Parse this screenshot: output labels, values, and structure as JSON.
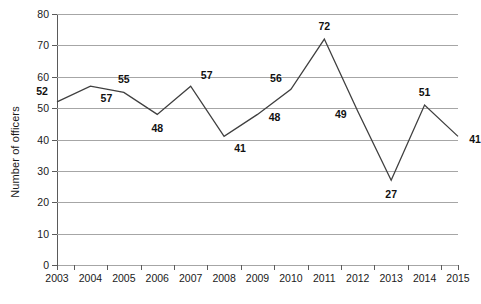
{
  "chart_data": {
    "type": "line",
    "title": "",
    "xlabel": "",
    "ylabel": "Number of officers",
    "categories": [
      "2003",
      "2004",
      "2005",
      "2006",
      "2007",
      "2008",
      "2009",
      "2010",
      "2011",
      "2012",
      "2013",
      "2014",
      "2015"
    ],
    "values": [
      52,
      57,
      55,
      48,
      57,
      41,
      48,
      56,
      72,
      49,
      27,
      51,
      41
    ],
    "series": [
      {
        "name": "Number of officers",
        "values": [
          52,
          57,
          55,
          48,
          57,
          41,
          48,
          56,
          72,
          49,
          27,
          51,
          41
        ]
      }
    ],
    "ylim": [
      0,
      80
    ],
    "ytick_values": [
      0,
      10,
      20,
      30,
      40,
      50,
      60,
      70,
      80
    ],
    "ytick_labels": [
      "0",
      "10",
      "20",
      "30",
      "40",
      "50",
      "60",
      "70",
      "80"
    ],
    "grid": "horizontal",
    "legend": "none",
    "data_labels": [
      {
        "category": "2003",
        "value": 52,
        "text": "52",
        "placement": "above-left"
      },
      {
        "category": "2004",
        "value": 57,
        "text": "57",
        "placement": "below-right"
      },
      {
        "category": "2005",
        "value": 55,
        "text": "55",
        "placement": "above"
      },
      {
        "category": "2006",
        "value": 48,
        "text": "48",
        "placement": "below"
      },
      {
        "category": "2007",
        "value": 57,
        "text": "57",
        "placement": "above-right"
      },
      {
        "category": "2008",
        "value": 41,
        "text": "41",
        "placement": "below-right"
      },
      {
        "category": "2009",
        "value": 48,
        "text": "48",
        "placement": "right"
      },
      {
        "category": "2010",
        "value": 56,
        "text": "56",
        "placement": "above-left"
      },
      {
        "category": "2011",
        "value": 72,
        "text": "72",
        "placement": "above"
      },
      {
        "category": "2012",
        "value": 49,
        "text": "49",
        "placement": "left"
      },
      {
        "category": "2013",
        "value": 27,
        "text": "27",
        "placement": "below"
      },
      {
        "category": "2014",
        "value": 51,
        "text": "51",
        "placement": "above"
      },
      {
        "category": "2015",
        "value": 41,
        "text": "41",
        "placement": "right"
      }
    ],
    "colors": {
      "line": "#3f3f3f",
      "gridline": "#a6a6a6",
      "axis": "#5a5a5a",
      "label_text": "#111111",
      "background": "#ffffff"
    }
  }
}
